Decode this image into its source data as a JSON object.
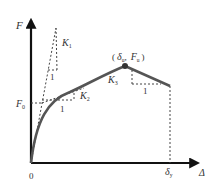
{
  "diagram": {
    "type": "force-displacement curve",
    "axes": {
      "y_label": "F",
      "x_label": "Δ",
      "origin_label": "0"
    },
    "labels": {
      "f0": "F",
      "f0_sub": "0",
      "peak_open": "(",
      "peak_delta": "δ",
      "peak_delta_sub": "u",
      "peak_sep": ",",
      "peak_f": "F",
      "peak_f_sub": "u",
      "peak_close": ")",
      "delta_y": "δ",
      "delta_y_sub": "y",
      "k1": "K",
      "k1_sub": "1",
      "k2": "K",
      "k2_sub": "2",
      "k3": "K",
      "k3_sub": "3",
      "unit_1a": "1",
      "unit_1b": "1",
      "unit_1c": "1"
    },
    "colors": {
      "axis": "#111111",
      "curve": "#555555",
      "dashed": "#444444",
      "text": "#333333"
    }
  }
}
